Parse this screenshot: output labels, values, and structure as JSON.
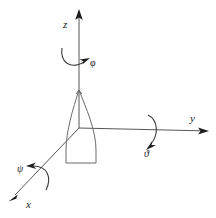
{
  "figure": {
    "background_color": "#ffffff",
    "line_color": "#555555",
    "arrow_color": "#1d1d1d",
    "body_outline_color": "#6a6a6a",
    "width": 216,
    "height": 218
  },
  "axes": [
    {
      "id": "z",
      "label": "z",
      "direction": "up",
      "origin": {
        "x": 79,
        "y": 128
      },
      "tip": {
        "x": 79,
        "y": 10
      },
      "label_pos": {
        "x": 64,
        "y": 24
      }
    },
    {
      "id": "y",
      "label": "y",
      "direction": "right",
      "origin": {
        "x": 79,
        "y": 128
      },
      "tip": {
        "x": 208,
        "y": 131
      },
      "label_pos": {
        "x": 191,
        "y": 121
      }
    },
    {
      "id": "x",
      "label": "x",
      "direction": "down-left",
      "origin": {
        "x": 79,
        "y": 128
      },
      "tip": {
        "x": 9,
        "y": 201
      },
      "label_pos": {
        "x": 27,
        "y": 206
      }
    }
  ],
  "rotations": [
    {
      "id": "phi",
      "label": "φ",
      "about_axis": "z",
      "label_pos": {
        "x": 90,
        "y": 64
      },
      "description": "roll rotation about the z axis"
    },
    {
      "id": "theta",
      "label": "ϑ",
      "about_axis": "y",
      "label_pos": {
        "x": 146,
        "y": 153
      },
      "description": "pitch rotation about the y axis"
    },
    {
      "id": "psi",
      "label": "ψ",
      "about_axis": "x",
      "label_pos": {
        "x": 19,
        "y": 172
      },
      "description": "yaw rotation about the x axis"
    }
  ],
  "body": {
    "name": "projectile-body",
    "shape": "teardrop-with-flat-base",
    "nose": {
      "x": 79,
      "y": 90
    },
    "base_left": {
      "x": 66,
      "y": 163
    },
    "base_right": {
      "x": 96,
      "y": 163
    }
  }
}
